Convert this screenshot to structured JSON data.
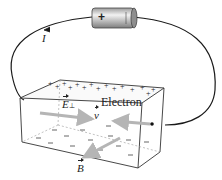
{
  "diagram": {
    "title": "",
    "battery": {
      "positive_symbol": "+",
      "negative_symbol": ""
    },
    "current_label": "I",
    "labels": {
      "electric_field": "E",
      "electric_field_subscript": "⊥",
      "velocity": "v",
      "electron": "Electron",
      "magnetic_field": "B"
    },
    "charges": {
      "top_surface": "+",
      "bottom_surface": "–"
    },
    "colors": {
      "wire": "#1a1a1a",
      "box_edge": "#333333",
      "vector_arrow": "#b5b5b5",
      "battery_body": "#c8c8c8",
      "text": "#222222"
    }
  }
}
